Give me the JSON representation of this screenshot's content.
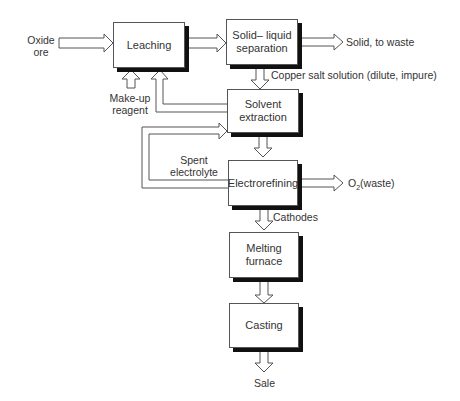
{
  "diagram": {
    "type": "process-flowchart",
    "nodes": {
      "leaching": "Leaching",
      "solid_liquid_line1": "Solid– liquid",
      "solid_liquid_line2": "separation",
      "solvent_line1": "Solvent",
      "solvent_line2": "extraction",
      "electrorefining": "Electrorefining",
      "melting_line1": "Melting",
      "melting_line2": "furnace",
      "casting": "Casting"
    },
    "labels": {
      "oxide_line1": "Oxide",
      "oxide_line2": "ore",
      "makeup_line1": "Make-up",
      "makeup_line2": "reagent",
      "solid_waste": "Solid, to waste",
      "copper_salt": "Copper salt solution (dilute, impure)",
      "spent_line1": "Spent",
      "spent_line2": "electrolyte",
      "o2_prefix": "O",
      "o2_sub": "2",
      "o2_suffix": "(waste)",
      "cathodes": "Cathodes",
      "sale": "Sale"
    },
    "edges": [
      {
        "from": "Oxide ore",
        "to": "Leaching"
      },
      {
        "from": "Make-up reagent",
        "to": "Leaching"
      },
      {
        "from": "Leaching",
        "to": "Solid–liquid separation"
      },
      {
        "from": "Solid–liquid separation",
        "to": "Solid, to waste"
      },
      {
        "from": "Solid–liquid separation",
        "to": "Solvent extraction",
        "label": "Copper salt solution (dilute, impure)"
      },
      {
        "from": "Solvent extraction",
        "to": "Leaching"
      },
      {
        "from": "Solvent extraction",
        "to": "Electrorefining"
      },
      {
        "from": "Electrorefining",
        "to": "Solvent extraction",
        "label": "Spent electrolyte"
      },
      {
        "from": "Electrorefining",
        "to": "O2 (waste)"
      },
      {
        "from": "Electrorefining",
        "to": "Melting furnace",
        "label": "Cathodes"
      },
      {
        "from": "Melting furnace",
        "to": "Casting"
      },
      {
        "from": "Casting",
        "to": "Sale"
      }
    ]
  }
}
